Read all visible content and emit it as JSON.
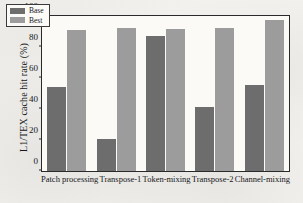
{
  "chart_data": {
    "type": "bar",
    "title": "",
    "xlabel": "",
    "ylabel": "L1/TEX cache hit rate (%)",
    "ylim": [
      0,
      100
    ],
    "yticks": [
      0,
      20,
      40,
      60,
      80,
      100
    ],
    "grid": false,
    "legend_position": "upper-left",
    "categories": [
      "Patch processing",
      "Transpose-1",
      "Token-mixing",
      "Transpose-2",
      "Channel-mixing"
    ],
    "series": [
      {
        "name": "Base",
        "color": "#6d6d6d",
        "values": [
          54.5,
          20.5,
          87.0,
          41.0,
          55.5
        ]
      },
      {
        "name": "Best",
        "color": "#9c9c9c",
        "values": [
          91.0,
          92.0,
          91.5,
          92.5,
          97.5
        ]
      }
    ]
  }
}
